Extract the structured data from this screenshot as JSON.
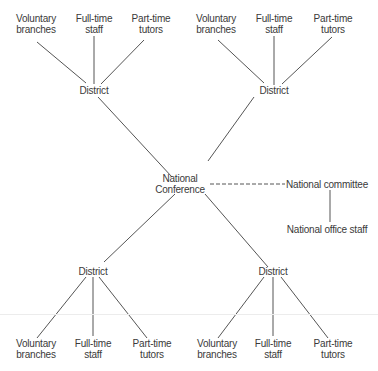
{
  "diagram": {
    "title": "",
    "top_left": {
      "district": "District",
      "children": [
        {
          "line1": "Voluntary",
          "line2": "branches"
        },
        {
          "line1": "Full-time",
          "line2": "staff"
        },
        {
          "line1": "Part-time",
          "line2": "tutors"
        }
      ]
    },
    "top_right": {
      "district": "District",
      "children": [
        {
          "line1": "Voluntary",
          "line2": "branches"
        },
        {
          "line1": "Full-time",
          "line2": "staff"
        },
        {
          "line1": "Part-time",
          "line2": "tutors"
        }
      ]
    },
    "center": {
      "line1": "National",
      "line2": "Conference",
      "committee": "National committee",
      "office_staff": "National office staff"
    },
    "bottom_left": {
      "district": "District",
      "children": [
        {
          "line1": "Voluntary",
          "line2": "branches"
        },
        {
          "line1": "Full-time",
          "line2": "staff"
        },
        {
          "line1": "Part-time",
          "line2": "tutors"
        }
      ]
    },
    "bottom_right": {
      "district": "District",
      "children": [
        {
          "line1": "Voluntary",
          "line2": "branches"
        },
        {
          "line1": "Full-time",
          "line2": "staff"
        },
        {
          "line1": "Part-time",
          "line2": "tutors"
        }
      ]
    },
    "line_color": "#555555"
  }
}
